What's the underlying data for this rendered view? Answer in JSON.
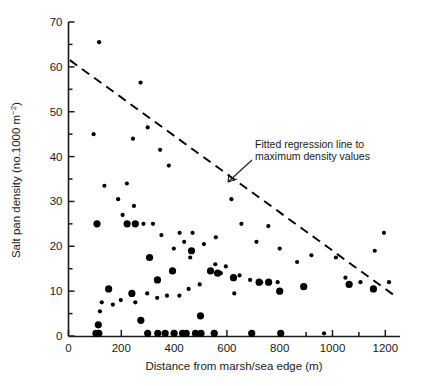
{
  "chart_data": {
    "type": "scatter",
    "title": "",
    "xlabel": "Distance from marsh/sea edge (m)",
    "ylabel": "Salt pan density (no.1000 m⁻²)",
    "ylabel_main": "Salt pan density (no.1000 m",
    "ylabel_sup": "−2",
    "ylabel_tail": ")",
    "xlim": [
      0,
      1250
    ],
    "ylim": [
      0,
      70
    ],
    "x_ticks_major": [
      0,
      200,
      400,
      600,
      800,
      1000,
      1200
    ],
    "x_ticks_minor": [
      100,
      300,
      500,
      700,
      900,
      1100
    ],
    "y_ticks_major": [
      0,
      10,
      20,
      30,
      40,
      50,
      60,
      70
    ],
    "y_ticks_minor": [
      5,
      15,
      25,
      35,
      45,
      55,
      65
    ],
    "x_tick_labels": [
      "0",
      "200",
      "400",
      "600",
      "800",
      "1000",
      "1200"
    ],
    "y_tick_labels": [
      "0",
      "10",
      "20",
      "30",
      "40",
      "50",
      "60",
      "70"
    ],
    "grid": false,
    "legend": "none",
    "annotations": [
      {
        "name": "regression-annotation",
        "line1": "Fitted regression line to",
        "line2": "maximum density values",
        "text_x": 255,
        "text_y": 148,
        "leader": {
          "x1": 252,
          "y1": 160,
          "x2": 228,
          "y2": 182
        }
      }
    ],
    "series": [
      {
        "name": "salt pan density observations (small marker)",
        "marker": "circle-small",
        "marker_radius": 2.1,
        "color": "#000000",
        "points": [
          [
            116,
            65.5
          ],
          [
            95,
            45.0
          ],
          [
            273,
            56.5
          ],
          [
            244,
            44.0
          ],
          [
            300,
            46.5
          ],
          [
            347,
            41.5
          ],
          [
            380,
            38.0
          ],
          [
            136,
            33.5
          ],
          [
            221,
            34.0
          ],
          [
            188,
            30.5
          ],
          [
            248,
            29.0
          ],
          [
            284,
            25.0
          ],
          [
            320,
            25.0
          ],
          [
            205,
            27.0
          ],
          [
            352,
            22.5
          ],
          [
            421,
            23.0
          ],
          [
            470,
            23.0
          ],
          [
            438,
            21.0
          ],
          [
            399,
            19.5
          ],
          [
            461,
            17.5
          ],
          [
            513,
            20.5
          ],
          [
            558,
            22.0
          ],
          [
            617,
            30.5
          ],
          [
            655,
            25.0
          ],
          [
            712,
            21.0
          ],
          [
            757,
            24.5
          ],
          [
            800,
            19.5
          ],
          [
            866,
            16.5
          ],
          [
            920,
            18.0
          ],
          [
            1013,
            17.5
          ],
          [
            1049,
            13.0
          ],
          [
            1106,
            12.0
          ],
          [
            1195,
            23.0
          ],
          [
            1214,
            12.0
          ],
          [
            1160,
            19.0
          ],
          [
            556,
            16.0
          ],
          [
            596,
            15.5
          ],
          [
            648,
            13.5
          ],
          [
            688,
            12.5
          ],
          [
            730,
            12.0
          ],
          [
            628,
            9.5
          ],
          [
            497,
            11.5
          ],
          [
            455,
            10.5
          ],
          [
            420,
            9.0
          ],
          [
            373,
            9.0
          ],
          [
            336,
            8.5
          ],
          [
            298,
            9.5
          ],
          [
            253,
            7.5
          ],
          [
            198,
            8.0
          ],
          [
            168,
            7.0
          ],
          [
            126,
            7.5
          ],
          [
            119,
            5.5
          ],
          [
            968,
            0.6
          ],
          [
            577,
            14.0
          ],
          [
            792,
            12.0
          ]
        ]
      },
      {
        "name": "salt pan density observations (large marker)",
        "marker": "circle-large",
        "marker_radius": 3.6,
        "color": "#000000",
        "points": [
          [
            108,
            25.0
          ],
          [
            222,
            25.0
          ],
          [
            253,
            25.0
          ],
          [
            307,
            17.5
          ],
          [
            337,
            12.5
          ],
          [
            466,
            19.0
          ],
          [
            394,
            14.5
          ],
          [
            538,
            14.5
          ],
          [
            565,
            14.0
          ],
          [
            625,
            13.0
          ],
          [
            722,
            12.0
          ],
          [
            758,
            12.0
          ],
          [
            800,
            10.0
          ],
          [
            891,
            11.0
          ],
          [
            1063,
            11.5
          ],
          [
            1155,
            10.5
          ],
          [
            152,
            10.5
          ],
          [
            240,
            9.5
          ],
          [
            113,
            2.5
          ],
          [
            115,
            0.6
          ],
          [
            104,
            0.6
          ],
          [
            300,
            0.6
          ],
          [
            338,
            0.6
          ],
          [
            366,
            0.6
          ],
          [
            400,
            0.6
          ],
          [
            432,
            0.6
          ],
          [
            446,
            0.6
          ],
          [
            481,
            0.6
          ],
          [
            502,
            0.6
          ],
          [
            552,
            0.6
          ],
          [
            694,
            0.6
          ],
          [
            804,
            0.6
          ],
          [
            500,
            4.5
          ],
          [
            274,
            3.5
          ]
        ]
      }
    ],
    "regression_line": {
      "name": "fitted-regression-line",
      "style": "dashed",
      "color": "#000000",
      "x1": 5,
      "y1": 61.5,
      "x2": 1235,
      "y2": 9.0
    }
  },
  "figure": {
    "background": "#ffffff",
    "axis_color": "#1a1a1a"
  }
}
